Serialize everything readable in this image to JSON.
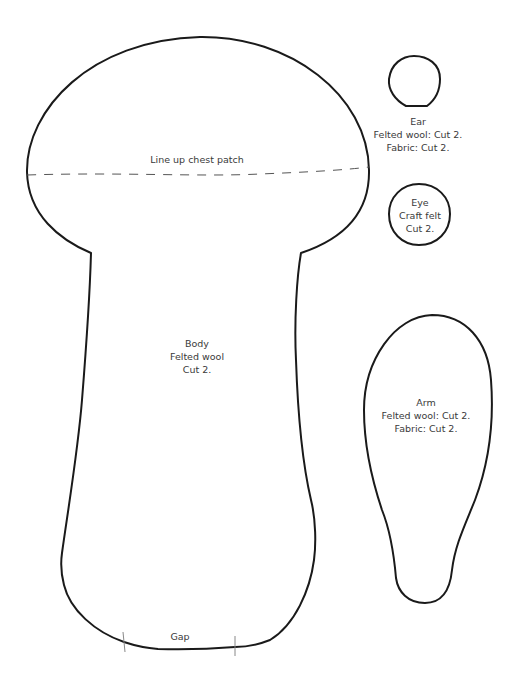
{
  "pieces": {
    "body": {
      "lines": [
        "Body",
        "Felted wool",
        "Cut 2."
      ],
      "chest_line_label": "Line up chest patch",
      "gap_label": "Gap"
    },
    "ear": {
      "lines": [
        "Ear",
        "Felted wool: Cut 2.",
        "Fabric: Cut 2."
      ]
    },
    "eye": {
      "lines": [
        "Eye",
        "Craft felt",
        "Cut 2."
      ]
    },
    "arm": {
      "lines": [
        "Arm",
        "Felted wool: Cut 2.",
        "Fabric: Cut 2."
      ]
    }
  },
  "colors": {
    "outline": "#1a1a1a",
    "text": "#3a3a3a",
    "background": "#ffffff"
  }
}
